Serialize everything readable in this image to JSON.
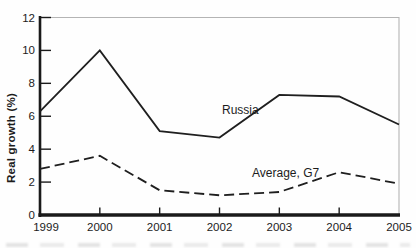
{
  "chart_data": {
    "type": "line",
    "title": "",
    "x": [
      1999,
      2000,
      2001,
      2002,
      2003,
      2004,
      2005
    ],
    "xlabel": "",
    "ylabel": "Real growth (%)",
    "ylim": [
      0,
      12
    ],
    "yticks": [
      0,
      2,
      4,
      6,
      8,
      10,
      12
    ],
    "grid": false,
    "legend_position": "inline-labels",
    "series": [
      {
        "name": "Russia",
        "line_style": "solid",
        "color": "#1f1f1f",
        "values": [
          6.3,
          10.0,
          5.1,
          4.7,
          7.3,
          7.2,
          5.5
        ]
      },
      {
        "name": "Average, G7",
        "line_style": "dashed",
        "color": "#1f1f1f",
        "values": [
          2.8,
          3.6,
          1.5,
          1.2,
          1.4,
          2.6,
          1.9
        ]
      }
    ],
    "axis_color": "#1a1a1a",
    "frame_color": "#b4b4b4"
  }
}
